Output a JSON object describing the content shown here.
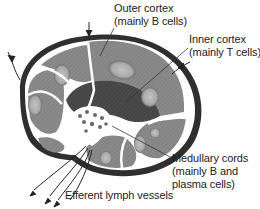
{
  "diagram": {
    "labels": {
      "outer_cortex": {
        "line1": "Outer cortex",
        "line2": "(mainly B cells)"
      },
      "inner_cortex": {
        "line1": "Inner cortex",
        "line2": "(mainly T cells)"
      },
      "medullary_cords": {
        "line1": "Medullary cords",
        "line2": "(mainly B and",
        "line3": "plasma cells)"
      },
      "efferent": {
        "line1": "Efferent lymph vessels"
      }
    },
    "colors": {
      "capsule": "#2f2f2f",
      "cortex_fill": "#8c8c8c",
      "follicle_fill": "#b4b4b4",
      "paracortex_fill": "#4a4a4a",
      "sinus": "#ffffff",
      "text": "#222222"
    }
  }
}
